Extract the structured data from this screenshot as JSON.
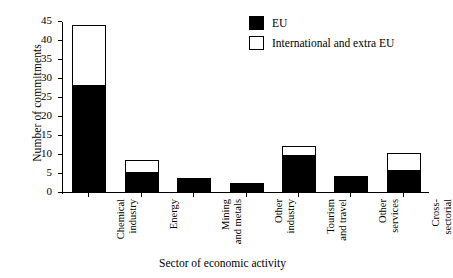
{
  "chart_data": {
    "type": "bar",
    "subtype": "stacked-vertical",
    "title": "",
    "xlabel": "Sector of economic activity",
    "ylabel": "Number of commitments",
    "ylim": [
      0,
      45
    ],
    "yticks": [
      0,
      5,
      10,
      15,
      20,
      25,
      30,
      35,
      40,
      45
    ],
    "grid": false,
    "legend_position": "top-right",
    "categories": [
      "Chemical industry",
      "Energy",
      "Mining and metals",
      "Other industry",
      "Tourism and travel",
      "Other services",
      "Cross-sectorial"
    ],
    "category_lines": [
      [
        "Chemical",
        "industry"
      ],
      [
        "Energy",
        ""
      ],
      [
        "Mining",
        "and metals"
      ],
      [
        "Other",
        "industry"
      ],
      [
        "Tourism",
        "and travel"
      ],
      [
        "Other",
        "services"
      ],
      [
        "Cross-",
        "sectorial"
      ]
    ],
    "series": [
      {
        "name": "EU",
        "color": "#000000",
        "values": [
          28,
          5,
          3.7,
          2.3,
          9.5,
          4.3,
          5.5
        ]
      },
      {
        "name": "International and extra EU",
        "color": "#ffffff",
        "values": [
          16,
          3.5,
          0,
          0,
          2.5,
          0,
          4.8
        ]
      }
    ],
    "totals": [
      44,
      8.5,
      3.7,
      2.3,
      12,
      4.3,
      10.3
    ]
  },
  "legend": {
    "items": [
      {
        "label": "EU",
        "swatch": "filled"
      },
      {
        "label": "International and extra EU",
        "swatch": "hollow"
      }
    ]
  },
  "axes": {
    "y_title": "Number of commitments",
    "x_title": "Sector of economic activity",
    "y_tick_labels": [
      "45",
      "40",
      "35",
      "30",
      "25",
      "20",
      "15",
      "10",
      "5",
      "0"
    ]
  }
}
